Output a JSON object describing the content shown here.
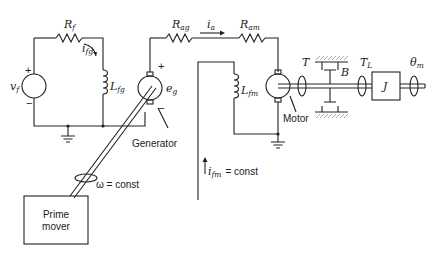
{
  "diagram": {
    "type": "electromechanical schematic",
    "field_circuit": {
      "source_label": "v",
      "source_sub": "f",
      "source_plus": "+",
      "source_minus": "−",
      "resistor_label": "R",
      "resistor_sub": "f",
      "current_label": "i",
      "current_sub": "fg",
      "inductor_label": "L",
      "inductor_sub": "fg"
    },
    "generator": {
      "name": "Generator",
      "emf_label": "e",
      "emf_sub": "g",
      "plus": "+",
      "minus": "−"
    },
    "armature_circuit": {
      "r_ag_label": "R",
      "r_ag_sub": "ag",
      "current_label": "i",
      "current_sub": "a",
      "r_am_label": "R",
      "r_am_sub": "am"
    },
    "motor_field": {
      "inductor_label": "L",
      "inductor_sub": "fm",
      "current_label": "i",
      "current_sub": "fm",
      "current_suffix": "= const"
    },
    "motor": {
      "name": "Motor",
      "torque_label": "T",
      "friction_label": "B",
      "load_torque_label": "T",
      "load_torque_sub": "L",
      "inertia_label": "J",
      "angle_label": "θ",
      "angle_sub": "m"
    },
    "prime_mover": {
      "line1": "Prime",
      "line2": "mover",
      "speed_label": "ω = const"
    }
  }
}
